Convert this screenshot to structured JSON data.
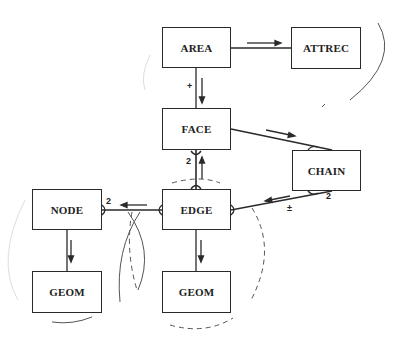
{
  "diagram": {
    "entities": [
      {
        "id": "area",
        "label": "AREA"
      },
      {
        "id": "attrec",
        "label": "ATTREC"
      },
      {
        "id": "face",
        "label": "FACE"
      },
      {
        "id": "chain",
        "label": "CHAIN"
      },
      {
        "id": "node",
        "label": "NODE"
      },
      {
        "id": "edge",
        "label": "EDGE"
      },
      {
        "id": "geom_node",
        "label": "GEOM"
      },
      {
        "id": "geom_edge",
        "label": "GEOM"
      }
    ],
    "relationships": [
      {
        "from": "AREA",
        "to": "ATTREC"
      },
      {
        "from": "AREA",
        "to": "FACE",
        "label": "+"
      },
      {
        "from": "FACE",
        "to": "CHAIN"
      },
      {
        "from": "EDGE",
        "to": "FACE",
        "label": "2"
      },
      {
        "from": "CHAIN",
        "to": "EDGE",
        "labels": [
          "2",
          "±"
        ]
      },
      {
        "from": "EDGE",
        "to": "NODE",
        "label": "2"
      },
      {
        "from": "NODE",
        "to": "GEOM"
      },
      {
        "from": "EDGE",
        "to": "GEOM"
      }
    ],
    "labels": {
      "area_face": "+",
      "edge_face": "2",
      "chain_card": "2",
      "chain_edge_sign": "±",
      "node_edge": "2"
    }
  }
}
